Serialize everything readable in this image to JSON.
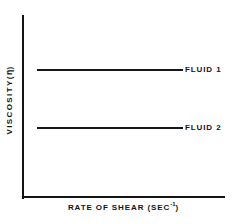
{
  "figure": {
    "background_color": "#ffffff",
    "ink_color": "#141414"
  },
  "chart_data": {
    "type": "line",
    "title": "",
    "subtitle": "",
    "xlabel_prefix": "RATE OF SHEAR (SEC",
    "xlabel_exponent": "-1",
    "xlabel_suffix": ")",
    "xlabel": "RATE OF SHEAR (SEC-1)",
    "ylabel_prefix": "VISCOSITY(",
    "ylabel_symbol": "η",
    "ylabel_suffix": ")",
    "ylabel": "VISCOSITY(η)",
    "grid": false,
    "xticks": [],
    "yticks": [],
    "xtick_labels": [],
    "ytick_labels": [],
    "xlim": [
      0,
      1
    ],
    "ylim": [
      0,
      1
    ],
    "legend_position": "right-inline",
    "annotations": [],
    "series": [
      {
        "name": "FLUID 1",
        "label": "FLUID 1",
        "style": "horizontal-constant",
        "x": [
          0.07,
          0.79
        ],
        "values": [
          0.7,
          0.7
        ],
        "color": "#171717"
      },
      {
        "name": "FLUID 2",
        "label": "FLUID 2",
        "style": "horizontal-constant",
        "x": [
          0.07,
          0.79
        ],
        "values": [
          0.38,
          0.38
        ],
        "color": "#171717"
      }
    ]
  }
}
